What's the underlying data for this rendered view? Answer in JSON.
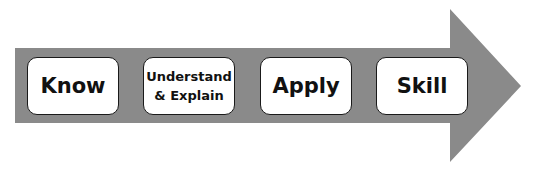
{
  "diagram": {
    "type": "process-arrow",
    "direction": "left-to-right",
    "colors": {
      "arrow_fill": "#8a8a8a",
      "box_fill": "#ffffff",
      "box_border": "#1a1a1a",
      "text": "#111111"
    },
    "stages": [
      {
        "label": "Know"
      },
      {
        "label": "Understand\n& Explain"
      },
      {
        "label": "Apply"
      },
      {
        "label": "Skill"
      }
    ]
  }
}
